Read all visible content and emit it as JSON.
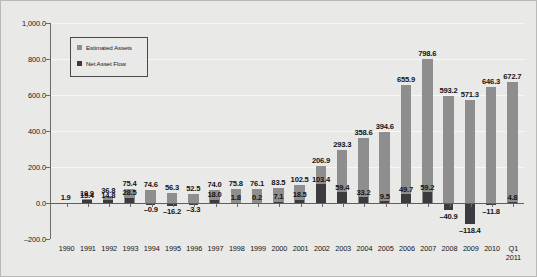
{
  "chart_data": {
    "type": "bar",
    "title": "",
    "subtitle": "",
    "xlabel": "",
    "ylabel": "",
    "ylim": [
      -200.0,
      1000.0
    ],
    "ytick_values": [
      1000.0,
      800.0,
      600.0,
      400.0,
      200.0,
      0.0,
      -200.0
    ],
    "ytick_labels": [
      "1,000.0",
      "800.0",
      "600.0",
      "400.0",
      "200.0",
      "0.0",
      "-200.0"
    ],
    "grid": true,
    "legend_position": "upper-left-inside",
    "categories": [
      "1990",
      "1991",
      "1992",
      "1993",
      "1994",
      "1995",
      "1996",
      "1997",
      "1998",
      "1999",
      "2000",
      "2001",
      "2002",
      "2003",
      "2004",
      "2005",
      "2006",
      "2007",
      "2008",
      "2009",
      "2010",
      "Q1 2011"
    ],
    "category_lines": [
      [
        "1990"
      ],
      [
        "1991"
      ],
      [
        "1992"
      ],
      [
        "1993"
      ],
      [
        "1994"
      ],
      [
        "1995"
      ],
      [
        "1996"
      ],
      [
        "1997"
      ],
      [
        "1998"
      ],
      [
        "1999"
      ],
      [
        "2000"
      ],
      [
        "2001"
      ],
      [
        "2002"
      ],
      [
        "2003"
      ],
      [
        "2004"
      ],
      [
        "2005"
      ],
      [
        "2006"
      ],
      [
        "2007"
      ],
      [
        "2008"
      ],
      [
        "2009"
      ],
      [
        "2010"
      ],
      [
        "Q1",
        "2011"
      ]
    ],
    "series": [
      {
        "name": "Estimated Assets",
        "color": "#8e8e8e",
        "values": [
          1.9,
          19.9,
          36.8,
          75.4,
          74.6,
          56.3,
          52.5,
          74.0,
          75.8,
          76.1,
          83.5,
          102.5,
          206.9,
          293.3,
          358.6,
          394.6,
          655.9,
          798.6,
          593.2,
          571.3,
          646.3,
          672.7
        ],
        "labels": [
          "1.9",
          "19.9",
          "36.8",
          "75.4",
          "74.6",
          "56.3",
          "52.5",
          "74.0",
          "75.8",
          "76.1",
          "83.5",
          "102.5",
          "206.9",
          "293.3",
          "358.6",
          "394.6",
          "655.9",
          "798.6",
          "593.2",
          "571.3",
          "646.3",
          "672.7"
        ]
      },
      {
        "name": "Net Asset Flow",
        "color": "#3b3b3f",
        "values": [
          null,
          15.4,
          14.8,
          28.5,
          -0.9,
          -16.2,
          -3.3,
          18.0,
          1.8,
          0.2,
          7.1,
          18.5,
          103.4,
          59.4,
          33.2,
          9.5,
          49.7,
          59.2,
          -40.9,
          -118.4,
          -11.8,
          4.8
        ],
        "labels": [
          "",
          "15.4",
          "14.8",
          "28.5",
          "-0.9",
          "-16.2",
          "-3.3",
          "18.0",
          "1.8",
          "0.2",
          "7.1",
          "18.5",
          "103.4",
          "59.4",
          "33.2",
          "9.5",
          "49.7",
          "59.2",
          "-40.9",
          "-118.4",
          "-11.8",
          "4.8"
        ]
      }
    ]
  },
  "legend": {
    "items": [
      {
        "label": "Estimated Assets"
      },
      {
        "label": "Net Asset Flow"
      }
    ]
  }
}
